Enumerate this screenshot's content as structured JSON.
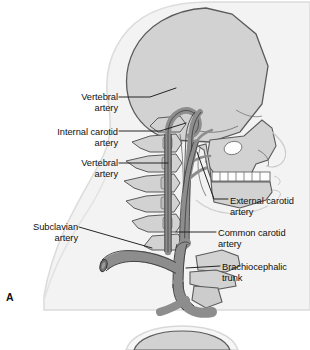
{
  "figure": {
    "panel_letter": "A",
    "view": "lateral view of head and neck arteries",
    "background_color": "#ffffff"
  },
  "palette": {
    "artery_fill": "#8d8d8d",
    "artery_outline": "#3c3c3c",
    "bone_fill": "#d2d2d2",
    "bone_outline": "#5a5a5a",
    "soft_tissue_fill": "#f3f3f3",
    "soft_tissue_outline": "#d8d8d8",
    "tooth_fill": "#fdfdfd",
    "leader_line": "#1b1b1b",
    "text": "#111111"
  },
  "labels": {
    "left": [
      {
        "id": "vertebral-artery-upper",
        "text": "Vertebral\nartery",
        "x": 42,
        "y": 92,
        "align": "right",
        "width": 76
      },
      {
        "id": "internal-carotid-artery",
        "text": "Internal carotid\nartery",
        "x": 18,
        "y": 127,
        "align": "right",
        "width": 100
      },
      {
        "id": "vertebral-artery-lower",
        "text": "Vertebral\nartery",
        "x": 42,
        "y": 158,
        "align": "right",
        "width": 76
      },
      {
        "id": "subclavian-artery",
        "text": "Subclavian\nartery",
        "x": 6,
        "y": 222,
        "align": "right",
        "width": 72
      }
    ],
    "right": [
      {
        "id": "external-carotid-artery",
        "text": "External carotid\nartery",
        "x": 230,
        "y": 196,
        "align": "left",
        "width": 80
      },
      {
        "id": "common-carotid-artery",
        "text": "Common carotid\nartery",
        "x": 218,
        "y": 228,
        "align": "left",
        "width": 92
      },
      {
        "id": "brachiocephalic-trunk",
        "text": "Brachiocephalic\ntrunk",
        "x": 222,
        "y": 262,
        "align": "left",
        "width": 88
      }
    ]
  },
  "leaders": [
    {
      "id": "leader-vertebral-upper",
      "points": "119,97 150,97 176,88"
    },
    {
      "id": "leader-internal-carotid",
      "points": "119,131 160,131 186,123"
    },
    {
      "id": "leader-vertebral-lower",
      "points": "119,163 168,163"
    },
    {
      "id": "leader-subclavian",
      "points": "79,227 152,248"
    },
    {
      "id": "leader-external-carotid",
      "points": "228,199 213,199 196,150"
    },
    {
      "id": "leader-common-carotid",
      "points": "216,232 176,232"
    },
    {
      "id": "leader-brachiocephalic",
      "points": "220,266 186,266"
    }
  ],
  "structures": [
    {
      "id": "cranium",
      "kind": "bone",
      "label": "skull vault"
    },
    {
      "id": "facial-skeleton",
      "kind": "bone",
      "label": "maxilla and facial bones"
    },
    {
      "id": "mandible",
      "kind": "bone",
      "label": "mandible"
    },
    {
      "id": "teeth",
      "kind": "bone",
      "label": "upper and lower teeth"
    },
    {
      "id": "cervical-vertebrae",
      "kind": "bone",
      "label": "cervical vertebrae C1-C7"
    },
    {
      "id": "clavicle",
      "kind": "bone",
      "label": "clavicle"
    },
    {
      "id": "first-rib",
      "kind": "bone",
      "label": "first rib"
    },
    {
      "id": "sternum",
      "kind": "bone",
      "label": "manubrium"
    },
    {
      "id": "head-silhouette",
      "kind": "soft",
      "label": "head and neck soft tissue profile"
    },
    {
      "id": "shoulder-silhouette",
      "kind": "soft",
      "label": "shoulder and chest contour"
    },
    {
      "id": "vertebral-artery",
      "kind": "artery",
      "label": "vertebral artery"
    },
    {
      "id": "internal-carotid",
      "kind": "artery",
      "label": "internal carotid artery"
    },
    {
      "id": "external-carotid",
      "kind": "artery",
      "label": "external carotid artery"
    },
    {
      "id": "common-carotid",
      "kind": "artery",
      "label": "common carotid artery"
    },
    {
      "id": "subclavian-artery",
      "kind": "artery",
      "label": "subclavian artery"
    },
    {
      "id": "brachiocephalic-trunk",
      "kind": "artery",
      "label": "brachiocephalic trunk"
    },
    {
      "id": "aortic-arch-stub",
      "kind": "artery",
      "label": "aortic arch"
    },
    {
      "id": "panel-b-top",
      "kind": "soft",
      "label": "top of second panel figure"
    }
  ]
}
